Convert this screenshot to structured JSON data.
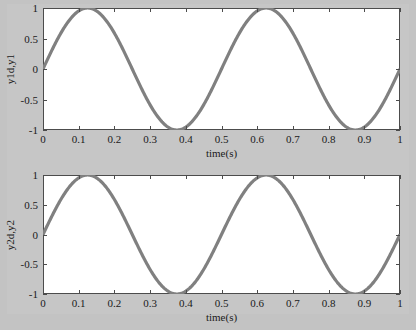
{
  "figure": {
    "background_color": "#c6c6c6",
    "axes_background_color": "#ffffff",
    "axes_border_color": "#4c4c4c",
    "line_color": "#808080"
  },
  "chart_data": [
    {
      "type": "line",
      "title": "",
      "xlabel": "time(s)",
      "ylabel": "y1d,y1",
      "xlim": [
        0,
        1
      ],
      "ylim": [
        -1,
        1
      ],
      "xticks": [
        0,
        0.1,
        0.2,
        0.3,
        0.4,
        0.5,
        0.6,
        0.7,
        0.8,
        0.9,
        1
      ],
      "xticklabels": [
        "0",
        "0.1",
        "0.2",
        "0.3",
        "0.4",
        "0.5",
        "0.6",
        "0.7",
        "0.8",
        "0.9",
        "1"
      ],
      "yticks": [
        -1,
        -0.5,
        0,
        0.5,
        1
      ],
      "yticklabels": [
        "-1",
        "-0.5",
        "0",
        "0.5",
        "1"
      ],
      "grid": false,
      "legend": null,
      "series": [
        {
          "name": "y1d,y1",
          "formula": "sin(4*pi*t)",
          "color": "#808080",
          "x": [
            0,
            0.02,
            0.04,
            0.06,
            0.08,
            0.1,
            0.125,
            0.15,
            0.17,
            0.19,
            0.21,
            0.23,
            0.25,
            0.27,
            0.29,
            0.31,
            0.33,
            0.35,
            0.375,
            0.4,
            0.42,
            0.44,
            0.46,
            0.48,
            0.5,
            0.52,
            0.54,
            0.56,
            0.58,
            0.6,
            0.625,
            0.65,
            0.67,
            0.69,
            0.71,
            0.73,
            0.75,
            0.77,
            0.79,
            0.81,
            0.83,
            0.85,
            0.875,
            0.9,
            0.92,
            0.94,
            0.96,
            0.98,
            1
          ],
          "y": [
            0,
            0.249,
            0.482,
            0.684,
            0.841,
            0.951,
            1,
            0.951,
            0.844,
            0.685,
            0.482,
            0.249,
            0,
            -0.249,
            -0.482,
            -0.685,
            -0.844,
            -0.951,
            -1,
            -0.951,
            -0.841,
            -0.684,
            -0.482,
            -0.249,
            0,
            0.249,
            0.482,
            0.684,
            0.841,
            0.951,
            1,
            0.951,
            0.844,
            0.685,
            0.482,
            0.249,
            0,
            -0.249,
            -0.482,
            -0.685,
            -0.844,
            -0.951,
            -1,
            -0.951,
            -0.841,
            -0.684,
            -0.482,
            -0.249,
            0
          ]
        }
      ]
    },
    {
      "type": "line",
      "title": "",
      "xlabel": "time(s)",
      "ylabel": "y2d,y2",
      "xlim": [
        0,
        1
      ],
      "ylim": [
        -1,
        1
      ],
      "xticks": [
        0,
        0.1,
        0.2,
        0.3,
        0.4,
        0.5,
        0.6,
        0.7,
        0.8,
        0.9,
        1
      ],
      "xticklabels": [
        "0",
        "0.1",
        "0.2",
        "0.3",
        "0.4",
        "0.5",
        "0.6",
        "0.7",
        "0.8",
        "0.9",
        "1"
      ],
      "yticks": [
        -1,
        -0.5,
        0,
        0.5,
        1
      ],
      "yticklabels": [
        "-1",
        "-0.5",
        "0",
        "0.5",
        "1"
      ],
      "grid": false,
      "legend": null,
      "series": [
        {
          "name": "y2d,y2",
          "formula": "sin(4*pi*t)",
          "color": "#808080",
          "x": [
            0,
            0.02,
            0.04,
            0.06,
            0.08,
            0.1,
            0.125,
            0.15,
            0.17,
            0.19,
            0.21,
            0.23,
            0.25,
            0.27,
            0.29,
            0.31,
            0.33,
            0.35,
            0.375,
            0.4,
            0.42,
            0.44,
            0.46,
            0.48,
            0.5,
            0.52,
            0.54,
            0.56,
            0.58,
            0.6,
            0.625,
            0.65,
            0.67,
            0.69,
            0.71,
            0.73,
            0.75,
            0.77,
            0.79,
            0.81,
            0.83,
            0.85,
            0.875,
            0.9,
            0.92,
            0.94,
            0.96,
            0.98,
            1
          ],
          "y": [
            0,
            0.249,
            0.482,
            0.684,
            0.841,
            0.951,
            1,
            0.951,
            0.844,
            0.685,
            0.482,
            0.249,
            0,
            -0.249,
            -0.482,
            -0.685,
            -0.844,
            -0.951,
            -1,
            -0.951,
            -0.841,
            -0.684,
            -0.482,
            -0.249,
            0,
            0.249,
            0.482,
            0.684,
            0.841,
            0.951,
            1,
            0.951,
            0.844,
            0.685,
            0.482,
            0.249,
            0,
            -0.249,
            -0.482,
            -0.685,
            -0.844,
            -0.951,
            -1,
            -0.951,
            -0.841,
            -0.684,
            -0.482,
            -0.249,
            0
          ]
        }
      ]
    }
  ]
}
